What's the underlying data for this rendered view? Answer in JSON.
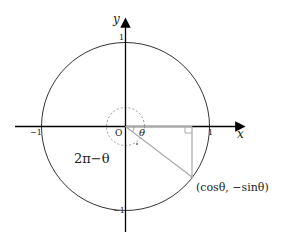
{
  "diagram": {
    "axes": {
      "x_label": "x",
      "y_label": "y",
      "origin_label": "O"
    },
    "ticks": {
      "x_pos": "1",
      "x_neg": "−1",
      "y_pos": "1",
      "y_neg": "−1"
    },
    "angle_label": "θ",
    "reflex_angle_label": "2π−θ",
    "point_label": "(cosθ, −sinθ)",
    "colors": {
      "axis": "#000000",
      "circle": "#333333",
      "segment": "#aaaaaa",
      "dashed": "#999999"
    }
  }
}
